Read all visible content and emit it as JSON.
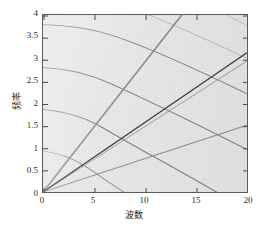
{
  "figure": {
    "background": "#ffffff",
    "plot_background": "#e9e9e9",
    "frame_color": "#5a5a5a"
  },
  "axes": {
    "x_title": "波数",
    "y_title": "频率",
    "x_ticks": [
      "0",
      "5",
      "10",
      "15",
      "20"
    ],
    "y_ticks": [
      "0",
      "0.5",
      "1",
      "1.5",
      "2",
      "2.5",
      "3",
      "3.5",
      "4"
    ]
  },
  "chart_data": {
    "type": "line",
    "title": "",
    "subtitle": "",
    "xlabel": "波数",
    "ylabel": "频率",
    "xlim": [
      0,
      20
    ],
    "ylim": [
      0,
      4
    ],
    "xticks": [
      0,
      5,
      10,
      15,
      20
    ],
    "yticks": [
      0,
      0.5,
      1,
      1.5,
      2,
      2.5,
      3,
      3.5,
      4
    ],
    "grid": false,
    "legend": false,
    "legend_position": "none",
    "annotations": [],
    "series": [
      {
        "name": "ray-1-steepest",
        "kind": "ray_from_origin",
        "color": "#8d8d8d",
        "width": 1.6,
        "slope": 0.295,
        "x": [
          0,
          13.6
        ],
        "y": [
          0,
          4.0
        ]
      },
      {
        "name": "ray-2-dark-main",
        "kind": "ray_from_origin",
        "color": "#3a3a3a",
        "width": 1.7,
        "slope": 0.1575,
        "x": [
          0,
          20
        ],
        "y": [
          0,
          3.15
        ]
      },
      {
        "name": "ray-3",
        "kind": "ray_from_origin",
        "color": "#a0a0a0",
        "width": 1.2,
        "slope": 0.148,
        "x": [
          0,
          20
        ],
        "y": [
          0,
          2.96
        ]
      },
      {
        "name": "ray-4-lowest",
        "kind": "ray_from_origin",
        "color": "#8f8f8f",
        "width": 1.5,
        "slope": 0.0755,
        "x": [
          0,
          20
        ],
        "y": [
          0,
          1.51
        ]
      },
      {
        "name": "curve-1",
        "kind": "hyperbolic_branch",
        "color": "#7e7e7e",
        "width": 1.4,
        "y_at_x0": 3.78,
        "x": [
          0,
          2,
          4,
          6,
          8,
          10,
          12,
          14,
          16,
          18,
          20
        ],
        "y": [
          3.78,
          3.83,
          3.95,
          4.12,
          4.34,
          4.6,
          4.89,
          5.2,
          5.53,
          5.87,
          6.22
        ]
      },
      {
        "name": "curve-2",
        "kind": "hyperbolic_branch",
        "color": "#7e7e7e",
        "width": 1.4,
        "y_at_x0": 2.81,
        "x": [
          0,
          2,
          4,
          6,
          8,
          10,
          12,
          14,
          16,
          18,
          20
        ],
        "y": [
          2.81,
          2.88,
          3.07,
          3.34,
          3.67,
          4.04,
          4.43,
          4.84,
          5.26,
          5.69,
          6.12
        ]
      },
      {
        "name": "curve-3",
        "kind": "hyperbolic_branch",
        "color": "#7e7e7e",
        "width": 1.4,
        "y_at_x0": 1.86,
        "x": [
          0,
          2,
          4,
          6,
          8,
          10,
          12,
          14,
          16,
          18,
          20
        ],
        "y": [
          1.86,
          1.96,
          2.24,
          2.63,
          3.07,
          3.54,
          4.03,
          4.52,
          5.02,
          5.52,
          6.02
        ]
      },
      {
        "name": "curve-4",
        "kind": "hyperbolic_branch",
        "color": "#8c8c8c",
        "width": 1.2,
        "y_at_x0": 0.92,
        "x": [
          0,
          2,
          4,
          6,
          8,
          10,
          12,
          14,
          16,
          18,
          20
        ],
        "y": [
          0.92,
          1.09,
          1.51,
          2.04,
          2.61,
          3.2,
          3.79,
          4.39,
          4.99,
          5.59,
          6.19
        ]
      },
      {
        "name": "curve-5-faint",
        "kind": "hyperbolic_branch",
        "color": "#a8a8a8",
        "width": 1.0,
        "y_at_x0": 4.62,
        "x": [
          0,
          2,
          4,
          6,
          8,
          10,
          12,
          14,
          16,
          18,
          20
        ],
        "y": [
          4.62,
          4.66,
          4.75,
          4.9,
          5.09,
          5.32,
          5.58,
          5.86,
          6.16,
          6.47,
          6.79
        ]
      }
    ]
  }
}
